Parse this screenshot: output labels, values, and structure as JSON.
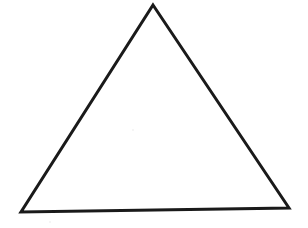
{
  "canvas": {
    "width": 308,
    "height": 228,
    "background_color": "#ffffff"
  },
  "figure": {
    "name": "triangle",
    "shape_type": "triangle",
    "fill_color": "#ffffff",
    "stroke_color": "#1a1a1a",
    "stroke_width": 3,
    "vertices": [
      {
        "label": "apex",
        "x": 153,
        "y": 5
      },
      {
        "label": "bottom-right",
        "x": 289,
        "y": 208
      },
      {
        "label": "bottom-left",
        "x": 21,
        "y": 212
      }
    ],
    "points_attr": "153,5 289,208 21,212",
    "edges": [
      {
        "label": "left-edge",
        "from": "apex",
        "to": "bottom-left"
      },
      {
        "label": "right-edge",
        "from": "apex",
        "to": "bottom-right"
      },
      {
        "label": "base-edge",
        "from": "bottom-left",
        "to": "bottom-right"
      }
    ]
  },
  "artifacts": [
    {
      "label": "faint-speck-base-left",
      "x": 50,
      "y": 222,
      "color": "#f2f2f2"
    },
    {
      "label": "faint-speck-interior",
      "x": 133,
      "y": 130,
      "color": "#f2f2f2"
    }
  ]
}
